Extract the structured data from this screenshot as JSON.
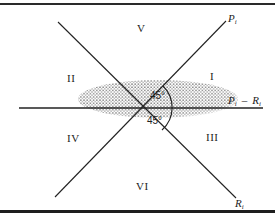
{
  "diagram": {
    "regions": [
      {
        "id": "I",
        "label": "I"
      },
      {
        "id": "II",
        "label": "II"
      },
      {
        "id": "III",
        "label": "III"
      },
      {
        "id": "IV",
        "label": "IV"
      },
      {
        "id": "V",
        "label": "V"
      },
      {
        "id": "VI",
        "label": "VI"
      }
    ],
    "axes": {
      "p_line": {
        "base": "P",
        "sub": "i"
      },
      "r_line": {
        "base": "R",
        "sub": "i"
      },
      "horizontal": {
        "left_base": "P",
        "left_sub": "i",
        "operator": "–",
        "right_base": "R",
        "right_sub": "i"
      }
    },
    "angles": [
      {
        "label": "45°"
      },
      {
        "label": "45°"
      }
    ],
    "colors": {
      "line": "#222222",
      "border": "#2a2a2a",
      "stipple": "#555555",
      "background": "#ffffff"
    }
  }
}
